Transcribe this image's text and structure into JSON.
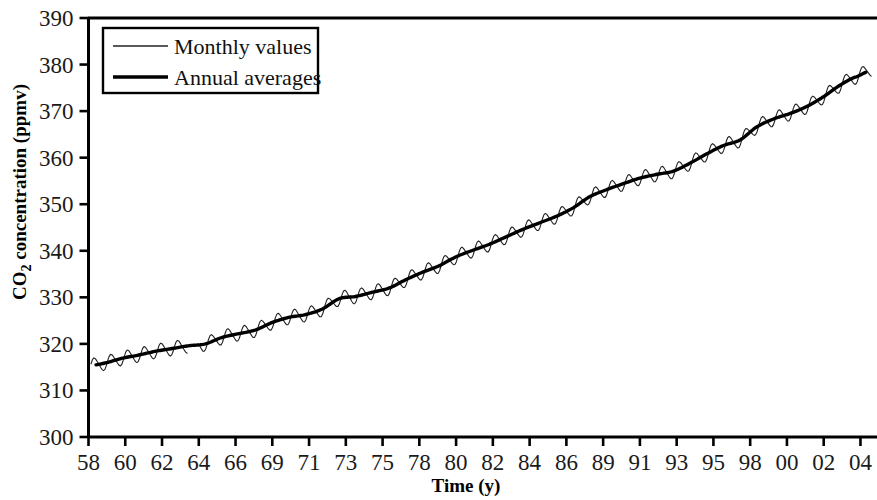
{
  "chart_data": {
    "type": "line",
    "title": "",
    "xlabel": "Time (y)",
    "ylabel": "CO2 concentration (ppmv)",
    "ylabel_parts": {
      "pre": "CO",
      "sub": "2",
      "post": " concentration (ppmv)"
    },
    "xlim": [
      1958,
      2005.2
    ],
    "ylim": [
      300,
      390
    ],
    "ytick_step": 10,
    "yticks": [
      300,
      310,
      320,
      330,
      340,
      350,
      360,
      370,
      380,
      390
    ],
    "xticks": [
      "58",
      "60",
      "62",
      "64",
      "66",
      "69",
      "71",
      "73",
      "75",
      "78",
      "80",
      "82",
      "84",
      "86",
      "89",
      "91",
      "93",
      "95",
      "98",
      "00",
      "02",
      "04"
    ],
    "xtick_years": [
      1958,
      1960,
      1962,
      1964,
      1966,
      1969,
      1971,
      1973,
      1975,
      1978,
      1980,
      1982,
      1984,
      1986,
      1989,
      1991,
      1993,
      1995,
      1998,
      2000,
      2002,
      2004
    ],
    "grid": false,
    "legend_position": "top-left",
    "legend": [
      {
        "label": "Monthly values",
        "style": "thin-line",
        "color": "#222222"
      },
      {
        "label": "Annual averages",
        "style": "thick-line",
        "color": "#000000"
      }
    ],
    "data_gap_years": [
      1963.9,
      1964.6
    ],
    "seasonal_amplitude_ppmv": 3.0,
    "seasonal_peak_month": 5,
    "series": [
      {
        "name": "Annual averages",
        "units": "ppmv",
        "x": [
          1958,
          1959,
          1960,
          1961,
          1962,
          1963,
          1964,
          1965,
          1966,
          1967,
          1968,
          1969,
          1970,
          1971,
          1972,
          1973,
          1974,
          1975,
          1976,
          1977,
          1978,
          1979,
          1980,
          1981,
          1982,
          1983,
          1984,
          1985,
          1986,
          1987,
          1988,
          1989,
          1990,
          1991,
          1992,
          1993,
          1994,
          1995,
          1996,
          1997,
          1998,
          1999,
          2000,
          2001,
          2002,
          2003,
          2004
        ],
        "values": [
          315.3,
          315.9,
          316.9,
          317.6,
          318.4,
          319.0,
          319.6,
          320.0,
          321.4,
          322.2,
          323.0,
          324.6,
          325.7,
          326.3,
          327.5,
          329.7,
          330.2,
          331.1,
          332.0,
          333.8,
          335.4,
          336.8,
          338.7,
          340.1,
          341.4,
          343.0,
          344.6,
          346.0,
          347.4,
          349.2,
          351.6,
          353.1,
          354.4,
          355.6,
          356.4,
          357.1,
          358.8,
          360.8,
          362.6,
          363.8,
          366.6,
          368.3,
          369.5,
          371.0,
          373.1,
          375.6,
          377.4
        ]
      },
      {
        "name": "Monthly values",
        "units": "ppmv",
        "description": "Mauna Loa monthly mean CO2; seasonal cycle of about 3 ppmv superimposed on the annual mean trend, with a data gap in 1964.",
        "start_year": 1958,
        "end_year": 2004.9,
        "start_value": 315.7,
        "end_value": 376.5,
        "max_value": 380.6,
        "min_value": 312.7
      }
    ]
  },
  "figure": {
    "background_color": "#ffffff",
    "axis_color": "#000000",
    "monthly_color": "#222222",
    "annual_color": "#000000"
  }
}
